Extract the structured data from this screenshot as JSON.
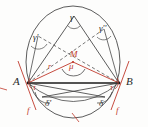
{
  "figure": {
    "type": "geometry-diagram",
    "colors": {
      "stroke_black": "#2b2b2b",
      "stroke_gray": "#6b6b6b",
      "accent_red": "#c0392b",
      "background": "#fdfdfc"
    },
    "labels": {
      "point_a": "A",
      "point_b": "B",
      "center": "M",
      "radius": "r",
      "central_angle": "μ",
      "inscribed_top": "γ",
      "inscribed_left": "γ'",
      "inscribed_right": "γ''",
      "tangent_chord_left": "τ",
      "tangent_chord_right": "τ",
      "lower_left": "δ'",
      "lower_right": "δ",
      "tangent_left": "f",
      "tangent_right": "f"
    },
    "elements": {
      "circle": "circumcircle",
      "chord": "AB",
      "center_point": "M",
      "radii": [
        "MA",
        "MB"
      ],
      "tangents": [
        "f at A",
        "f at B"
      ]
    }
  }
}
